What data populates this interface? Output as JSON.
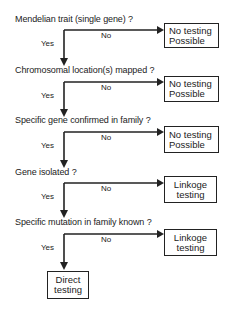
{
  "flowchart": {
    "steps": [
      {
        "question": "Mendelian trait (single gene) ?",
        "yes_label": "Yes",
        "no_label": "No",
        "no_outcome": [
          "No testing",
          "Possible"
        ]
      },
      {
        "question": "Chromosomal location(s) mapped ?",
        "yes_label": "Yes",
        "no_label": "No",
        "no_outcome": [
          "No testing",
          "Possible"
        ]
      },
      {
        "question": "Specific gene confirmed in family ?",
        "yes_label": "Yes",
        "no_label": "No",
        "no_outcome": [
          "No testing",
          "Possible"
        ]
      },
      {
        "question": "Gene isolated ?",
        "yes_label": "Yes",
        "no_label": "No",
        "no_outcome": [
          "Linkoge",
          "testing"
        ]
      },
      {
        "question": "Specific mutation in family known ?",
        "yes_label": "Yes",
        "no_label": "No",
        "no_outcome": [
          "Linkoge",
          "testing"
        ]
      }
    ],
    "final_outcome": [
      "Direct",
      "testing"
    ],
    "line_color": "#222222"
  }
}
